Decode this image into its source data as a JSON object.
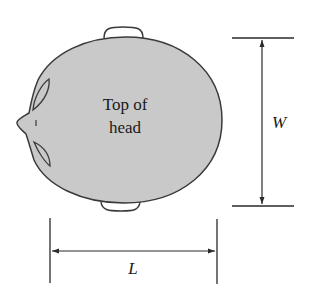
{
  "figure": {
    "head_label_line1": "Top of",
    "head_label_line2": "head",
    "width_label": "W",
    "length_label": "L"
  },
  "colors": {
    "head_fill": "#c9c9c9",
    "stroke": "#3a3a3a",
    "ear_fill": "#ffffff",
    "background": "#ffffff"
  }
}
